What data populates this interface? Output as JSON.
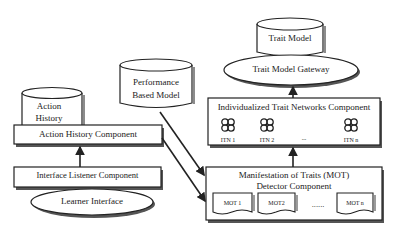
{
  "diagram": {
    "nodes": {
      "trait_model": {
        "label": "Trait Model",
        "shape": "cylinder"
      },
      "trait_model_gateway": {
        "label": "Trait Model Gateway",
        "shape": "ellipse"
      },
      "performance_based_model": {
        "label_line1": "Performance",
        "label_line2": "Based Model",
        "shape": "cylinder"
      },
      "action_history": {
        "label_line1": "Action",
        "label_line2": "History",
        "shape": "cylinder"
      },
      "action_history_component": {
        "label": "Action History Component",
        "shape": "box"
      },
      "interface_listener_component": {
        "label": "Interface Listener Component",
        "shape": "box"
      },
      "learner_interface": {
        "label": "Learner Interface",
        "shape": "ellipse"
      },
      "itn_component": {
        "label": "Individualized Trait Networks Component",
        "shape": "box",
        "items": [
          {
            "label": "ITN 1",
            "icon": "network-icon"
          },
          {
            "label": "ITN 2",
            "icon": "network-icon"
          },
          {
            "label": "...",
            "icon": ""
          },
          {
            "label": "ITN n",
            "icon": "network-icon"
          }
        ]
      },
      "mot_detector_component": {
        "label_line1": "Manifestation of Traits (MOT)",
        "label_line2": "Detector Component",
        "shape": "box",
        "items": [
          {
            "label": "MOT 1",
            "shape": "document"
          },
          {
            "label": "MOT2",
            "shape": "document"
          },
          {
            "label": "......",
            "shape": "ellipsis"
          },
          {
            "label": "MOT n",
            "shape": "document"
          }
        ]
      }
    },
    "edges": [
      {
        "from": "interface_listener_component",
        "to": "action_history_component"
      },
      {
        "from": "performance_based_model",
        "to": "mot_detector_component"
      },
      {
        "from": "action_history_component",
        "to": "mot_detector_component"
      },
      {
        "from": "mot_detector_component",
        "to": "itn_component"
      },
      {
        "from": "itn_component",
        "to": "trait_model_gateway"
      }
    ],
    "colors": {
      "stroke": "#222222",
      "fill": "#ffffff",
      "shadow": "#555555"
    }
  }
}
